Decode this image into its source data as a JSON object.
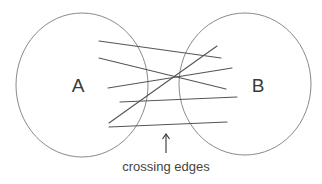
{
  "diagram": {
    "type": "bipartite-crossing-edges",
    "sets": [
      {
        "id": "A",
        "label": "A",
        "cx": 82,
        "cy": 85,
        "rx": 66,
        "ry": 72,
        "label_x": 78,
        "label_y": 85
      },
      {
        "id": "B",
        "label": "B",
        "cx": 245,
        "cy": 84,
        "rx": 66,
        "ry": 71,
        "label_x": 258,
        "label_y": 85
      }
    ],
    "edges": [
      {
        "x1": 99,
        "y1": 41,
        "x2": 221,
        "y2": 58
      },
      {
        "x1": 99,
        "y1": 58,
        "x2": 226,
        "y2": 89
      },
      {
        "x1": 108,
        "y1": 88,
        "x2": 232,
        "y2": 68
      },
      {
        "x1": 120,
        "y1": 102,
        "x2": 237,
        "y2": 97
      },
      {
        "x1": 109,
        "y1": 123,
        "x2": 217,
        "y2": 46
      },
      {
        "x1": 109,
        "y1": 127,
        "x2": 227,
        "y2": 122
      }
    ],
    "arrow": {
      "x": 166,
      "y_top": 134,
      "y_bottom": 153
    },
    "caption": {
      "text": "crossing edges",
      "x": 166,
      "y": 160
    },
    "colors": {
      "circle": "#8a8a8a",
      "edge": "#555555",
      "text": "#3a3a3a",
      "background": "#ffffff"
    }
  }
}
